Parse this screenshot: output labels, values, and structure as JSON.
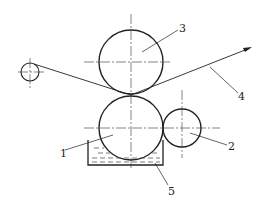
{
  "diagram": {
    "type": "roller coating mechanism schematic",
    "labels": [
      {
        "id": "1",
        "text": "1",
        "x": 60,
        "y": 157
      },
      {
        "id": "2",
        "text": "2",
        "x": 228,
        "y": 150
      },
      {
        "id": "3",
        "text": "3",
        "x": 179,
        "y": 32
      },
      {
        "id": "4",
        "text": "4",
        "x": 238,
        "y": 100
      },
      {
        "id": "5",
        "text": "5",
        "x": 168,
        "y": 195
      }
    ],
    "components": {
      "roller_1": {
        "cx": 131,
        "cy": 128,
        "r": 32
      },
      "roller_2": {
        "cx": 182,
        "cy": 128,
        "r": 19
      },
      "roller_3": {
        "cx": 131,
        "cy": 62,
        "r": 32
      },
      "guide_roller": {
        "cx": 30,
        "cy": 72,
        "r": 9
      },
      "tank": {
        "x1": 88,
        "y1": 140,
        "x2": 163,
        "y2": 165
      }
    },
    "colors": {
      "line": "#222222",
      "background": "#ffffff"
    }
  }
}
